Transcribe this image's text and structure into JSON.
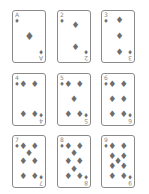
{
  "suit": "diamonds",
  "suit_symbol": "♦",
  "pip_color": "#6e6e6e",
  "border_color": "#8a8a8a",
  "cards": [
    {
      "rank": "A",
      "suit": "♦"
    },
    {
      "rank": "2",
      "suit": "♦"
    },
    {
      "rank": "3",
      "suit": "♦"
    },
    {
      "rank": "4",
      "suit": "♦"
    },
    {
      "rank": "5",
      "suit": "♦"
    },
    {
      "rank": "6",
      "suit": "♦"
    },
    {
      "rank": "7",
      "suit": "♦"
    },
    {
      "rank": "8",
      "suit": "♦"
    },
    {
      "rank": "9",
      "suit": "♦"
    }
  ]
}
